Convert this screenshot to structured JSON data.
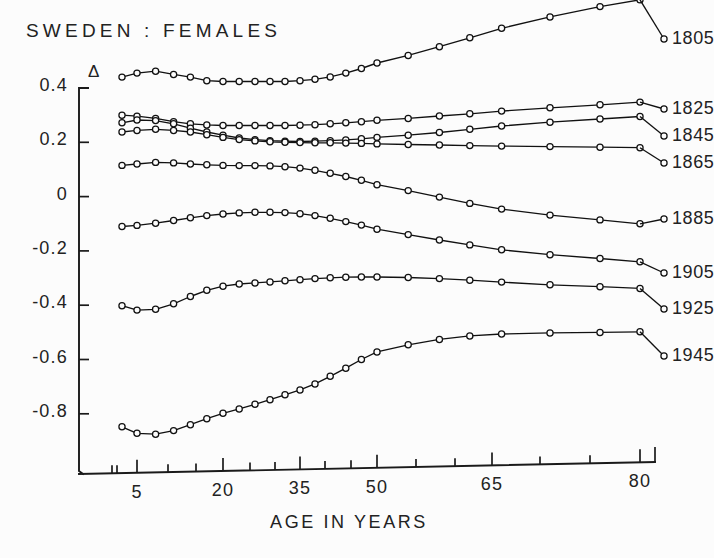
{
  "chart_data": {
    "type": "line",
    "title": "SWEDEN : FEMALES",
    "subtitle": "",
    "xlabel": "AGE IN YEARS",
    "ylabel": "Δ",
    "ylabel_symbol": "Δ",
    "x_tick_labels": [
      "5",
      "20",
      "35",
      "50",
      "65",
      "80"
    ],
    "x_tick_values": [
      5,
      20,
      35,
      50,
      65,
      80
    ],
    "x_minor_tick_values": [
      0,
      1,
      5,
      10,
      15,
      20,
      25,
      30,
      35,
      40,
      45,
      50,
      55,
      60,
      65,
      70,
      75,
      80
    ],
    "y_tick_labels": [
      "0.4",
      "0.2",
      "0",
      "-0.2",
      "-0.4",
      "-0.6",
      "-0.8"
    ],
    "y_tick_values": [
      0.4,
      0.2,
      0,
      -0.2,
      -0.4,
      -0.6,
      -0.8
    ],
    "xlim": [
      0,
      80
    ],
    "ylim": [
      -0.95,
      0.78
    ],
    "grid": false,
    "legend_position": "right-end-labels",
    "marker": "open-circle",
    "x": [
      2,
      5,
      8,
      11,
      14,
      17,
      20,
      23,
      26,
      29,
      32,
      35,
      38,
      41,
      44,
      47,
      50,
      54,
      58,
      62,
      66,
      71,
      76,
      80
    ],
    "series": [
      {
        "name": "1805",
        "label": "1805",
        "values": [
          0.44,
          0.455,
          0.462,
          0.45,
          0.44,
          0.427,
          0.424,
          0.424,
          0.424,
          0.424,
          0.424,
          0.427,
          0.432,
          0.441,
          0.455,
          0.472,
          0.492,
          0.52,
          0.552,
          0.585,
          0.62,
          0.662,
          0.7,
          0.725
        ]
      },
      {
        "name": "1825",
        "label": "1825",
        "values": [
          0.3,
          0.296,
          0.288,
          0.276,
          0.268,
          0.264,
          0.262,
          0.262,
          0.262,
          0.262,
          0.262,
          0.263,
          0.265,
          0.268,
          0.272,
          0.276,
          0.281,
          0.288,
          0.297,
          0.305,
          0.315,
          0.327,
          0.338,
          0.348
        ]
      },
      {
        "name": "1845",
        "label": "1845",
        "values": [
          0.272,
          0.282,
          0.28,
          0.268,
          0.252,
          0.238,
          0.226,
          0.216,
          0.21,
          0.206,
          0.204,
          0.203,
          0.204,
          0.206,
          0.209,
          0.213,
          0.218,
          0.226,
          0.236,
          0.248,
          0.26,
          0.274,
          0.286,
          0.295
        ]
      },
      {
        "name": "1865",
        "label": "1865",
        "values": [
          0.238,
          0.244,
          0.248,
          0.244,
          0.238,
          0.228,
          0.218,
          0.21,
          0.205,
          0.202,
          0.2,
          0.199,
          0.198,
          0.198,
          0.197,
          0.196,
          0.194,
          0.192,
          0.19,
          0.188,
          0.186,
          0.184,
          0.182,
          0.18
        ]
      },
      {
        "name": "1885",
        "label": "1885",
        "values": [
          0.115,
          0.12,
          0.126,
          0.124,
          0.12,
          0.117,
          0.115,
          0.114,
          0.114,
          0.113,
          0.11,
          0.105,
          0.097,
          0.086,
          0.074,
          0.06,
          0.044,
          0.022,
          -0.002,
          -0.025,
          -0.046,
          -0.068,
          -0.086,
          -0.1
        ]
      },
      {
        "name": "1905",
        "label": "1905",
        "values": [
          -0.11,
          -0.106,
          -0.098,
          -0.088,
          -0.078,
          -0.07,
          -0.064,
          -0.06,
          -0.058,
          -0.058,
          -0.059,
          -0.063,
          -0.07,
          -0.08,
          -0.092,
          -0.105,
          -0.12,
          -0.14,
          -0.16,
          -0.178,
          -0.196,
          -0.214,
          -0.228,
          -0.24
        ]
      },
      {
        "name": "1925",
        "label": "1925",
        "values": [
          -0.402,
          -0.418,
          -0.415,
          -0.395,
          -0.368,
          -0.345,
          -0.33,
          -0.322,
          -0.318,
          -0.314,
          -0.31,
          -0.306,
          -0.302,
          -0.299,
          -0.297,
          -0.296,
          -0.296,
          -0.298,
          -0.302,
          -0.308,
          -0.315,
          -0.325,
          -0.332,
          -0.338
        ]
      },
      {
        "name": "1945",
        "label": "1945",
        "values": [
          -0.848,
          -0.872,
          -0.875,
          -0.862,
          -0.84,
          -0.818,
          -0.798,
          -0.782,
          -0.765,
          -0.748,
          -0.73,
          -0.712,
          -0.69,
          -0.662,
          -0.632,
          -0.6,
          -0.572,
          -0.546,
          -0.526,
          -0.513,
          -0.506,
          -0.502,
          -0.5,
          -0.498
        ]
      }
    ]
  }
}
